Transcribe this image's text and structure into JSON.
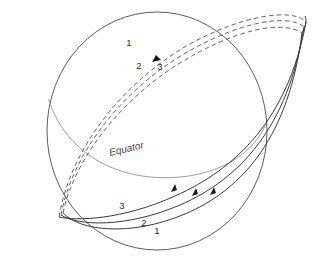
{
  "figure": {
    "background_color": "#ffffff"
  },
  "labels": {
    "equator": "Equator",
    "upper_orbit_1": "1",
    "upper_orbit_2": "2",
    "upper_orbit_3": "3",
    "lower_orbit_1": "1",
    "lower_orbit_2": "2",
    "lower_orbit_3": "3"
  },
  "colors": {
    "sphere_outline": "#4a4a4a",
    "equator_line": "#8c8c8c",
    "orbit_solid": "#3a3a3a",
    "orbit_dashed": "#5a5a5a",
    "arrow_fill": "#1a1a1a",
    "text": "#2b2b2b"
  },
  "geometry": {
    "sphere": {
      "center_x": 157,
      "center_y": 131,
      "radius_x": 110,
      "radius_y": 119
    },
    "equator": {
      "description": "front half of equatorial great circle, sweeping low-left to right"
    },
    "orbits": [
      {
        "name": "orbit-1",
        "label": "1",
        "inclination_offset": 0
      },
      {
        "name": "orbit-2",
        "label": "2",
        "inclination_offset": 1
      },
      {
        "name": "orbit-3",
        "label": "3",
        "inclination_offset": 2
      }
    ],
    "arrows_near_side": 3,
    "arrows_far_side": 1
  }
}
